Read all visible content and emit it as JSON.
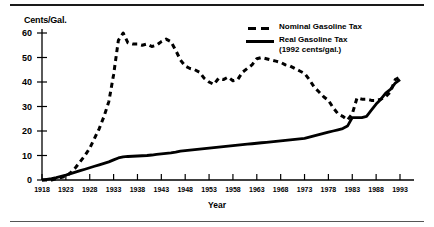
{
  "chart_data": {
    "type": "line",
    "title": "",
    "xlabel": "Year",
    "ylabel": "Cents/Gal.",
    "xlim": [
      1918,
      1993
    ],
    "ylim": [
      0,
      60
    ],
    "yticks": [
      0,
      10,
      20,
      30,
      40,
      50,
      60
    ],
    "xticks": [
      1918,
      1923,
      1928,
      1933,
      1938,
      1943,
      1948,
      1953,
      1958,
      1963,
      1968,
      1973,
      1978,
      1983,
      1988,
      1993
    ],
    "grid": false,
    "legend_position": "top-right",
    "series": [
      {
        "name": "Nominal Gasoline Tax",
        "style": "dashed",
        "color": "#000000",
        "x": [
          1918,
          1919,
          1920,
          1921,
          1922,
          1923,
          1924,
          1925,
          1926,
          1927,
          1928,
          1929,
          1930,
          1931,
          1932,
          1933,
          1934,
          1935,
          1936,
          1937,
          1938,
          1939,
          1940,
          1941,
          1942,
          1943,
          1944,
          1945,
          1946,
          1947,
          1948,
          1949,
          1950,
          1951,
          1952,
          1953,
          1954,
          1955,
          1956,
          1957,
          1958,
          1959,
          1960,
          1961,
          1962,
          1963,
          1964,
          1965,
          1966,
          1967,
          1968,
          1969,
          1970,
          1971,
          1972,
          1973,
          1974,
          1975,
          1976,
          1977,
          1978,
          1979,
          1980,
          1981,
          1982,
          1983,
          1984,
          1985,
          1986,
          1987,
          1988,
          1989,
          1990,
          1991,
          1992,
          1993
        ],
        "values": [
          0,
          0,
          0,
          0.5,
          1,
          1.5,
          3,
          5,
          7.5,
          10,
          13,
          17,
          21,
          26,
          32,
          43,
          57,
          60,
          56,
          55.5,
          55.5,
          55,
          55.5,
          54.5,
          55,
          56.5,
          57.5,
          56.5,
          53,
          49,
          46.5,
          45.5,
          45,
          44,
          41.5,
          40,
          39,
          41.5,
          41,
          42,
          40.5,
          41,
          44,
          45.5,
          47,
          49.5,
          50,
          49.5,
          49,
          48.5,
          48,
          47,
          46.5,
          45.5,
          44.5,
          43.5,
          41,
          38,
          36,
          34,
          32.5,
          29.5,
          27,
          26,
          24.5,
          27,
          33.5,
          33,
          33,
          32.5,
          32.5,
          33,
          34,
          36,
          41,
          42
        ]
      },
      {
        "name": "Real Gasoline Tax (1992 cents/gal.)",
        "style": "solid",
        "color": "#000000",
        "x": [
          1918,
          1919,
          1920,
          1921,
          1922,
          1923,
          1924,
          1925,
          1926,
          1927,
          1928,
          1929,
          1930,
          1931,
          1932,
          1933,
          1934,
          1935,
          1936,
          1937,
          1938,
          1939,
          1940,
          1941,
          1942,
          1943,
          1944,
          1945,
          1946,
          1947,
          1948,
          1949,
          1950,
          1951,
          1952,
          1953,
          1954,
          1955,
          1956,
          1957,
          1958,
          1959,
          1960,
          1961,
          1962,
          1963,
          1964,
          1965,
          1966,
          1967,
          1968,
          1969,
          1970,
          1971,
          1972,
          1973,
          1974,
          1975,
          1976,
          1977,
          1978,
          1979,
          1980,
          1981,
          1982,
          1983,
          1984,
          1985,
          1986,
          1987,
          1988,
          1989,
          1990,
          1991,
          1992,
          1993
        ],
        "values": [
          0,
          0.3,
          0.6,
          1,
          1.5,
          2,
          2.6,
          3.2,
          3.8,
          4.4,
          5,
          5.6,
          6.2,
          6.8,
          7.4,
          8.2,
          9,
          9.4,
          9.6,
          9.7,
          9.8,
          9.9,
          10,
          10.2,
          10.5,
          10.7,
          10.9,
          11.1,
          11.4,
          11.8,
          12,
          12.2,
          12.4,
          12.6,
          12.8,
          13,
          13.2,
          13.4,
          13.6,
          13.8,
          14,
          14.2,
          14.4,
          14.6,
          14.8,
          15,
          15.2,
          15.4,
          15.6,
          15.8,
          16,
          16.2,
          16.4,
          16.6,
          16.8,
          17,
          17.5,
          18,
          18.5,
          19,
          19.5,
          20,
          20.5,
          21,
          22,
          25.5,
          25.5,
          25.5,
          26,
          28.5,
          31,
          33,
          35.5,
          37,
          39.5,
          41
        ]
      }
    ]
  },
  "axis": {
    "ylabel_text": "Cents/Gal.",
    "xlabel_text": "Year"
  },
  "legend": {
    "items": [
      {
        "label": "Nominal Gasoline Tax",
        "sub": ""
      },
      {
        "label": "Real Gasoline Tax",
        "sub": "(1992 cents/gal.)"
      }
    ]
  }
}
